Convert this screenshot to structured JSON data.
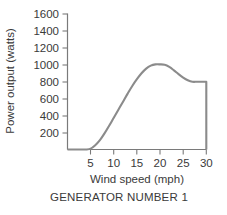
{
  "chart_data": {
    "type": "line",
    "title": "",
    "caption": "GENERATOR NUMBER 1",
    "xlabel": "Wind speed (mph)",
    "ylabel": "Power output (watts)",
    "xlim": [
      0,
      30
    ],
    "ylim": [
      0,
      1600
    ],
    "xticks": [
      5,
      10,
      15,
      20,
      25,
      30
    ],
    "xtick_labels": [
      "5",
      "10",
      "15",
      "20",
      "25",
      "30"
    ],
    "yticks": [
      200,
      400,
      600,
      800,
      1000,
      1200,
      1400,
      1600
    ],
    "ytick_labels": [
      "200",
      "400",
      "600",
      "800",
      "1000",
      "1200",
      "1400",
      "1600"
    ],
    "grid": false,
    "legend": null,
    "series": [
      {
        "name": "Power output",
        "color": "#8b8b8b",
        "x": [
          0,
          1,
          2,
          3,
          4,
          5,
          6,
          7,
          8,
          9,
          10,
          11,
          12,
          13,
          14,
          15,
          16,
          17,
          18,
          19,
          20,
          21,
          22,
          23,
          24,
          25,
          26,
          27,
          28,
          29,
          30,
          30
        ],
        "values": [
          0,
          0,
          0,
          0,
          0,
          10,
          50,
          110,
          190,
          280,
          375,
          470,
          565,
          660,
          750,
          830,
          900,
          955,
          990,
          1005,
          1005,
          1000,
          975,
          935,
          890,
          850,
          818,
          800,
          800,
          800,
          800,
          0
        ]
      }
    ],
    "annotations": {
      "cut_in_speed_mph": 5,
      "rated_peak_watts": 1005,
      "rated_peak_speed_mph": 20,
      "plateau_watts": 800,
      "cut_out_speed_mph": 30
    }
  },
  "axis_labels": {
    "x_title": "Wind speed (mph)",
    "y_title": "Power output (watts)"
  },
  "caption": {
    "text": "GENERATOR NUMBER 1"
  },
  "colors": {
    "curve": "#8b8b8b",
    "axis": "#7a7a7a",
    "text": "#3a3a3a",
    "background": "#ffffff"
  }
}
